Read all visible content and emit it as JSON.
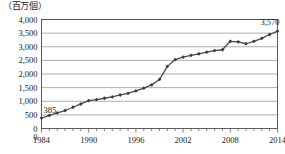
{
  "unit_label": "（百万個）",
  "chart_data": {
    "type": "line",
    "title": "",
    "subtitle": "",
    "xlabel": "",
    "ylabel": "（百万個）",
    "unit_note": "百万個",
    "grid": true,
    "legend": false,
    "legend_position": "none",
    "xlim": [
      1984,
      2014
    ],
    "ylim": [
      0,
      4000
    ],
    "ytick_step": 500,
    "ytick_labels": [
      "0",
      "500",
      "1,000",
      "1,500",
      "2,000",
      "2,500",
      "3,000",
      "3,500",
      "4,000"
    ],
    "ytick_values": [
      0,
      500,
      1000,
      1500,
      2000,
      2500,
      3000,
      3500,
      4000
    ],
    "xtick_labels": [
      "1984",
      "1990",
      "1996",
      "2002",
      "2008",
      "2014"
    ],
    "xtick_values": [
      1984,
      1990,
      1996,
      2002,
      2008,
      2014
    ],
    "x_minor_tick_step": 1,
    "marker": "diamond",
    "line_color": "#4a4a58",
    "marker_color": "#3c3c4a",
    "grid_color": "#8a8a8a",
    "axis_color": "#4d4d4d",
    "x": [
      1984,
      1985,
      1986,
      1987,
      1988,
      1989,
      1990,
      1991,
      1992,
      1993,
      1994,
      1995,
      1996,
      1997,
      1998,
      1999,
      2000,
      2001,
      2002,
      2003,
      2004,
      2005,
      2006,
      2007,
      2008,
      2009,
      2010,
      2011,
      2012,
      2013,
      2014
    ],
    "values": [
      385,
      480,
      570,
      660,
      780,
      900,
      1020,
      1060,
      1110,
      1160,
      1230,
      1290,
      1380,
      1480,
      1600,
      1800,
      2280,
      2530,
      2620,
      2680,
      2740,
      2800,
      2860,
      2890,
      3200,
      3180,
      3110,
      3200,
      3310,
      3450,
      3570
    ],
    "annotations": [
      {
        "label": "385",
        "x": 1984,
        "y": 385,
        "position": "above-right"
      },
      {
        "label": "3,570",
        "x": 2014,
        "y": 3570,
        "position": "above-left"
      }
    ]
  }
}
